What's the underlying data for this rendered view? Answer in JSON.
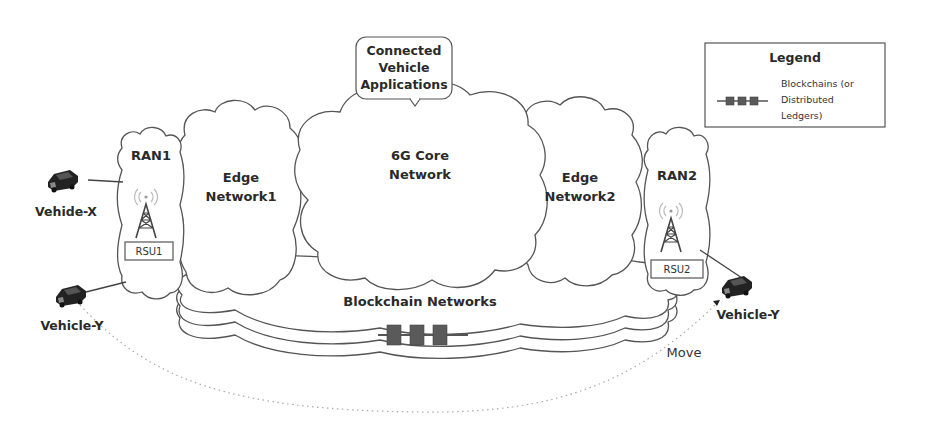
{
  "legend": {
    "title": "Legend",
    "items": [
      {
        "icon": "blockchain-chain-icon",
        "label_lines": [
          "Blockchains (or",
          "Distributed",
          "Ledgers)"
        ]
      }
    ]
  },
  "callout": {
    "lines": [
      "Connected",
      "Vehicle",
      "Applications"
    ]
  },
  "core": {
    "lines": [
      "6G Core",
      "Network"
    ]
  },
  "edge1": {
    "lines": [
      "Edge",
      "Network1"
    ]
  },
  "edge2": {
    "lines": [
      "Edge",
      "Network2"
    ]
  },
  "ran1": {
    "label": "RAN1",
    "rsu": "RSU1"
  },
  "ran2": {
    "label": "RAN2",
    "rsu": "RSU2"
  },
  "blockchain": {
    "label": "Blockchain Networks"
  },
  "vehicles": {
    "x": "Vehide-X",
    "y_left": "Vehicle-Y",
    "y_right": "Vehicle-Y"
  },
  "move_label": "Move",
  "colors": {
    "stroke": "#555555",
    "block": "#5a5a5a",
    "text": "#2a2a2a"
  }
}
